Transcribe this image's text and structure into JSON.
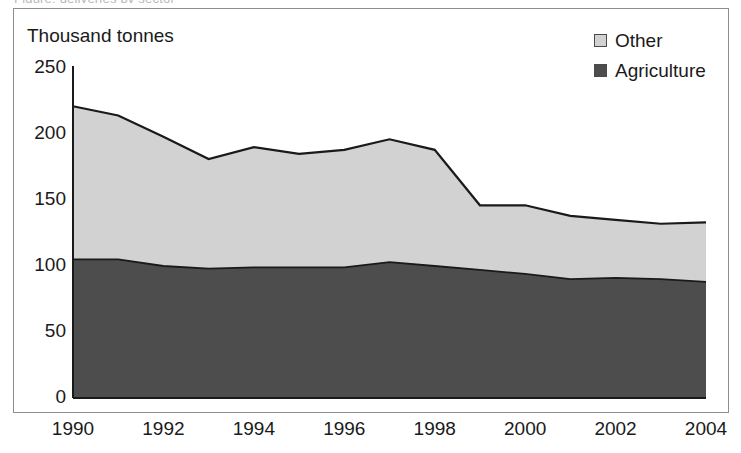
{
  "caption_clipped": "Figure: deliveries by sector",
  "axis": {
    "y_title": "Thousand tonnes",
    "y_ticks": [
      "0",
      "50",
      "100",
      "150",
      "200",
      "250"
    ],
    "x_ticks": [
      "1990",
      "1992",
      "1994",
      "1996",
      "1998",
      "2000",
      "2002",
      "2004"
    ]
  },
  "legend": {
    "items": [
      {
        "label": "Other",
        "color": "#d2d2d2"
      },
      {
        "label": "Agriculture",
        "color": "#4d4d4d"
      }
    ]
  },
  "colors": {
    "other_fill": "#d2d2d2",
    "agriculture_fill": "#4d4d4d",
    "line": "#1a1a1a",
    "frame": "#8d8d8d",
    "text": "#1a1a1a"
  },
  "chart_data": {
    "type": "area",
    "stacked": true,
    "title": "",
    "subtitle": "",
    "xlabel": "",
    "ylabel": "Thousand tonnes",
    "ylim": [
      0,
      250
    ],
    "xlim": [
      1990,
      2004
    ],
    "y_ticks": [
      0,
      50,
      100,
      150,
      200,
      250
    ],
    "x_ticks": [
      1990,
      1992,
      1994,
      1996,
      1998,
      2000,
      2002,
      2004
    ],
    "grid": false,
    "legend_position": "top-right",
    "x": [
      1990,
      1991,
      1992,
      1993,
      1994,
      1995,
      1996,
      1997,
      1998,
      1999,
      2000,
      2001,
      2002,
      2003,
      2004
    ],
    "series": [
      {
        "name": "Agriculture",
        "color": "#4d4d4d",
        "values": [
          105,
          105,
          100,
          98,
          99,
          99,
          99,
          103,
          100,
          97,
          94,
          90,
          91,
          90,
          88
        ]
      },
      {
        "name": "Other",
        "color": "#d2d2d2",
        "values": [
          116,
          109,
          98,
          83,
          91,
          86,
          89,
          93,
          88,
          49,
          52,
          48,
          44,
          42,
          45
        ]
      }
    ],
    "totals": [
      221,
      214,
      198,
      181,
      190,
      185,
      188,
      196,
      188,
      146,
      146,
      138,
      135,
      132,
      133
    ]
  }
}
